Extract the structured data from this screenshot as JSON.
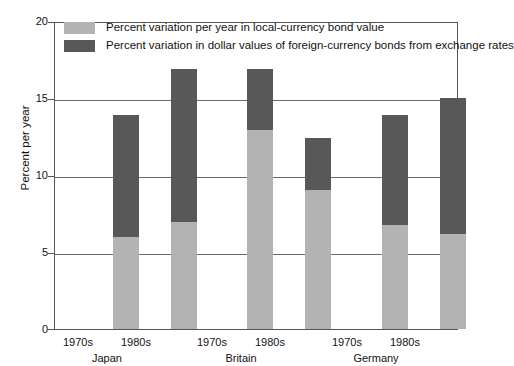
{
  "chart_data": {
    "type": "bar",
    "subtype": "stacked",
    "title": "",
    "xlabel": "",
    "ylabel": "Percent per year",
    "ylim": [
      0,
      20
    ],
    "yticks": [
      0,
      5,
      10,
      15,
      20
    ],
    "ytick_labels": [
      "0",
      "5",
      "10",
      "15",
      "20"
    ],
    "grid": true,
    "grid_axis": "y",
    "legend_position": "inside-top-left",
    "categories": [
      "1970s",
      "1980s",
      "1970s",
      "1980s",
      "1970s",
      "1980s"
    ],
    "groups": [
      {
        "name": "Japan",
        "categories": [
          "1970s",
          "1980s"
        ]
      },
      {
        "name": "Britain",
        "categories": [
          "1970s",
          "1980s"
        ]
      },
      {
        "name": "Germany",
        "categories": [
          "1970s",
          "1980s"
        ]
      }
    ],
    "series": [
      {
        "name": "Percent variation per year in local-currency bond value",
        "color": "#b3b3b3",
        "values": [
          6.0,
          7.0,
          13.0,
          9.1,
          6.8,
          6.2
        ]
      },
      {
        "name": "Percent variation in dollar values of foreign-currency bonds from exchange rates",
        "color": "#585858",
        "values": [
          8.0,
          10.0,
          4.0,
          3.4,
          7.2,
          8.9
        ]
      }
    ],
    "totals": [
      14.0,
      17.0,
      17.0,
      12.5,
      14.0,
      15.1
    ],
    "bars": [
      {
        "group": "Japan",
        "category": "1970s",
        "local": 6.0,
        "fx": 8.0,
        "total": 14.0
      },
      {
        "group": "Japan",
        "category": "1980s",
        "local": 7.0,
        "fx": 10.0,
        "total": 17.0
      },
      {
        "group": "Britain",
        "category": "1970s",
        "local": 13.0,
        "fx": 4.0,
        "total": 17.0
      },
      {
        "group": "Britain",
        "category": "1980s",
        "local": 9.1,
        "fx": 3.4,
        "total": 12.5
      },
      {
        "group": "Germany",
        "category": "1970s",
        "local": 6.8,
        "fx": 7.2,
        "total": 14.0
      },
      {
        "group": "Germany",
        "category": "1980s",
        "local": 6.2,
        "fx": 8.9,
        "total": 15.1
      }
    ]
  },
  "axis": {
    "y_title": "Percent per year",
    "y_tick_0": "0",
    "y_tick_1": "5",
    "y_tick_2": "10",
    "y_tick_3": "15",
    "y_tick_4": "20"
  },
  "x_labels": {
    "japan_1970s": "1970s",
    "japan_1980s": "1980s",
    "britain_1970s": "1970s",
    "britain_1980s": "1980s",
    "germany_1970s": "1970s",
    "germany_1980s": "1980s"
  },
  "group_labels": {
    "japan": "Japan",
    "britain": "Britain",
    "germany": "Germany"
  },
  "legend": {
    "item_local": "Percent variation per year in local-currency bond value",
    "item_fx": "Percent variation in dollar values of foreign-currency bonds from exchange rates"
  },
  "colors": {
    "local": "#b3b3b3",
    "fx": "#585858",
    "grid": "#6a6a6a",
    "frame": "#555555",
    "background": "#ffffff"
  }
}
